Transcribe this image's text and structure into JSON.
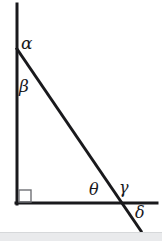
{
  "figure": {
    "background_color": "#ffffff",
    "stroke_color": "#19191c",
    "band_color": "#e9eaec",
    "labels": {
      "alpha": "α",
      "beta": "β",
      "theta": "θ",
      "gamma": "γ",
      "delta": "δ"
    },
    "geometry": {
      "vertical_line": {
        "x1": 17,
        "y1": 4,
        "x2": 17,
        "y2": 203
      },
      "horizontal_line": {
        "x1": 17,
        "y1": 203,
        "x2": 157,
        "y2": 203
      },
      "diagonal_line": {
        "x1": 17,
        "y1": 49,
        "x2": 141,
        "y2": 231
      },
      "right_angle_marker": {
        "x": 18,
        "y": 190,
        "size": 12
      },
      "apex_vertex": {
        "x": 17,
        "y": 49
      },
      "corner_vertex": {
        "x": 17,
        "y": 203
      },
      "crossing_point": {
        "x": 126,
        "y": 203
      }
    },
    "stroke_width": 3
  }
}
